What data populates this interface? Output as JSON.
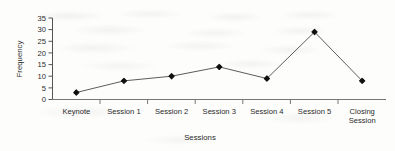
{
  "chart_data": {
    "type": "line",
    "title": "",
    "xlabel": "Sessions",
    "ylabel": "Frequency",
    "categories": [
      "Keynote",
      "Session 1",
      "Session 2",
      "Session 3",
      "Session 4",
      "Session 5",
      "Closing Session"
    ],
    "values": [
      3,
      8,
      10,
      14,
      9,
      29,
      8
    ],
    "series": [
      {
        "name": "Frequency",
        "values": [
          3,
          8,
          10,
          14,
          9,
          29,
          8
        ]
      }
    ],
    "ylim": [
      0,
      35
    ],
    "ytick_labels": [
      "0",
      "5",
      "10",
      "15",
      "20",
      "25",
      "30",
      "35"
    ],
    "ytick_values": [
      0,
      5,
      10,
      15,
      20,
      25,
      30,
      35
    ],
    "grid": false,
    "legend": false,
    "marker": "diamond",
    "line_color": "#4a4a4a",
    "marker_color": "#101010",
    "axis_color": "#555555",
    "text_color": "#2b2b2b",
    "background_color": "#fdfdfc"
  },
  "category_label_lines": [
    [
      "Keynote"
    ],
    [
      "Session 1"
    ],
    [
      "Session 2"
    ],
    [
      "Session 3"
    ],
    [
      "Session 4"
    ],
    [
      "Session 5"
    ],
    [
      "Closing",
      "Session"
    ]
  ]
}
